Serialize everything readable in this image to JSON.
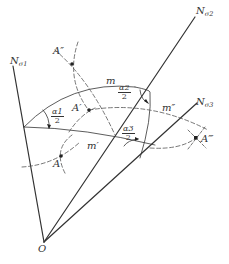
{
  "diagram": {
    "origin_label": "O",
    "axes": [
      {
        "name": "N",
        "sub": "σ1"
      },
      {
        "name": "N",
        "sub": "σ2"
      },
      {
        "name": "N",
        "sub": "σ3"
      }
    ],
    "points": {
      "A": "A",
      "A_prime": "A′",
      "A_double_prime": "A″",
      "A_triple_prime": "A‴"
    },
    "arcs": {
      "m": "m",
      "m_prime": "m′",
      "m_double_prime": "m″"
    },
    "angles": [
      {
        "num": "α1",
        "den": "2"
      },
      {
        "num": "α2",
        "den": "2"
      },
      {
        "num": "α3",
        "den": "2"
      }
    ],
    "colors": {
      "line": "#333333",
      "dashed": "#555555",
      "background": "#ffffff"
    }
  }
}
